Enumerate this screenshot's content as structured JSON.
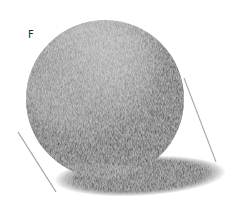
{
  "figure": {
    "label": "F",
    "colors": {
      "paper": "#ffffff",
      "highlight": "#f4f4f4",
      "halftone": "#bdbdbd",
      "core_shadow": "#2b2b2b",
      "reflected_light": "#6a6a6a",
      "cast_shadow": "#2e2e2e",
      "guide_line": "#9a9a9a"
    }
  }
}
